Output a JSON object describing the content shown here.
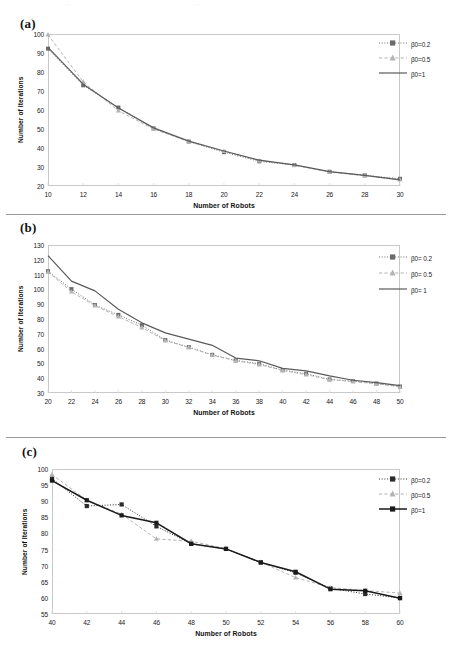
{
  "figure": {
    "panels": [
      {
        "label": "(a)",
        "xlabel": "Number of Robots",
        "ylabel": "Number of Iterations",
        "chart_data": {
          "type": "line",
          "title": "",
          "xlabel": "Number of Robots",
          "ylabel": "Number of Iterations",
          "xlim": [
            10,
            30
          ],
          "ylim": [
            20,
            100
          ],
          "xticks": [
            10,
            12,
            14,
            16,
            18,
            20,
            22,
            24,
            26,
            28,
            30
          ],
          "yticks": [
            20,
            30,
            40,
            50,
            60,
            70,
            80,
            90,
            100
          ],
          "grid": false,
          "legend_position": "top-right",
          "x": [
            10,
            12,
            14,
            16,
            18,
            20,
            22,
            24,
            26,
            28,
            30
          ],
          "series": [
            {
              "name": "β0=0.2",
              "marker": "square",
              "line": "dotted",
              "color": "#6b6b6b",
              "values": [
                92.3,
                73.0,
                61.3,
                50.3,
                43.4,
                37.8,
                33.0,
                31.0,
                27.5,
                25.6,
                23.8
              ]
            },
            {
              "name": "β0=0.5",
              "marker": "triangle",
              "line": "dashed",
              "color": "#b4b4b4",
              "values": [
                99.6,
                74.8,
                59.6,
                50.0,
                43.4,
                38.3,
                33.4,
                31.0,
                27.4,
                25.4,
                23.3
              ]
            },
            {
              "name": "β0=1",
              "marker": "none",
              "line": "solid",
              "color": "#5a5a5a",
              "values": [
                93.0,
                73.6,
                61.0,
                50.6,
                43.6,
                38.4,
                33.6,
                31.1,
                27.6,
                25.6,
                23.2
              ]
            }
          ]
        }
      },
      {
        "label": "(b)",
        "xlabel": "Number of Robots",
        "ylabel": "Number of Iterations",
        "chart_data": {
          "type": "line",
          "title": "",
          "xlabel": "Number of Robots",
          "ylabel": "Number of Iterations",
          "xlim": [
            20,
            50
          ],
          "ylim": [
            30,
            130
          ],
          "xticks": [
            20,
            22,
            24,
            26,
            28,
            30,
            32,
            34,
            36,
            38,
            40,
            42,
            44,
            46,
            48,
            50
          ],
          "yticks": [
            30,
            40,
            50,
            60,
            70,
            80,
            90,
            100,
            110,
            120,
            130
          ],
          "grid": false,
          "legend_position": "top-right",
          "x": [
            20,
            22,
            24,
            26,
            28,
            30,
            32,
            34,
            36,
            38,
            40,
            42,
            44,
            46,
            48,
            50
          ],
          "series": [
            {
              "name": "β0= 0.2",
              "marker": "square",
              "line": "dotted",
              "color": "#6b6b6b",
              "values": [
                112.3,
                100.2,
                89.5,
                82.8,
                75.8,
                65.8,
                61.0,
                55.8,
                52.0,
                49.8,
                45.4,
                43.0,
                39.2,
                38.0,
                36.4,
                34.4
              ]
            },
            {
              "name": "β0= 0.5",
              "marker": "triangle",
              "line": "dashed",
              "color": "#b4b4b4",
              "values": [
                111.8,
                98.4,
                89.0,
                81.6,
                74.2,
                65.4,
                60.8,
                55.6,
                51.8,
                49.2,
                45.2,
                42.4,
                39.0,
                37.8,
                36.2,
                34.2
              ]
            },
            {
              "name": "β0= 1",
              "marker": "none",
              "line": "solid",
              "color": "#5a5a5a",
              "values": [
                122.8,
                105.6,
                99.0,
                86.6,
                77.4,
                70.6,
                66.4,
                62.2,
                53.6,
                51.8,
                46.6,
                45.0,
                41.6,
                38.6,
                37.0,
                35.0
              ]
            }
          ]
        }
      },
      {
        "label": "(c)",
        "xlabel": "Number of Robots",
        "ylabel": "Number of Iterations",
        "chart_data": {
          "type": "line",
          "title": "",
          "xlabel": "Number of Robots",
          "ylabel": "Number of Iterations",
          "xlim": [
            40,
            60
          ],
          "ylim": [
            55,
            100
          ],
          "xticks": [
            40,
            42,
            44,
            46,
            48,
            50,
            52,
            54,
            56,
            58,
            60
          ],
          "yticks": [
            55,
            60,
            65,
            70,
            75,
            80,
            85,
            90,
            95,
            100
          ],
          "grid": false,
          "legend_position": "top-right",
          "x": [
            40,
            42,
            44,
            46,
            48,
            50,
            52,
            54,
            56,
            58,
            60
          ],
          "series": [
            {
              "name": "β0=0.2",
              "marker": "square",
              "line": "dotted",
              "color": "#2b2b2b",
              "values": [
                97.0,
                88.5,
                89.0,
                82.2,
                76.8,
                75.2,
                71.0,
                67.8,
                63.0,
                61.2,
                60.0
              ]
            },
            {
              "name": "β0=0.5",
              "marker": "triangle",
              "line": "dashed",
              "color": "#b4b4b4",
              "values": [
                98.3,
                90.3,
                86.0,
                78.3,
                77.6,
                75.3,
                71.1,
                66.3,
                63.2,
                62.3,
                61.5
              ]
            },
            {
              "name": "β0=1",
              "marker": "square",
              "line": "solid",
              "color": "#1a1a1a",
              "values": [
                96.4,
                90.3,
                85.6,
                83.3,
                76.8,
                75.2,
                71.0,
                68.1,
                62.7,
                62.2,
                59.9
              ]
            }
          ]
        }
      }
    ]
  }
}
